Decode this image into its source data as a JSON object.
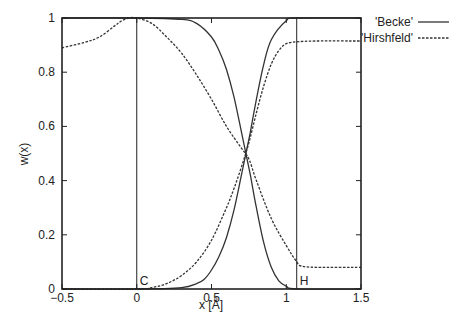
{
  "chart_data": {
    "type": "line",
    "title": "",
    "xlabel": "x [Å]",
    "ylabel": "w(x)",
    "xlim": [
      -0.5,
      1.5
    ],
    "ylim": [
      0,
      1
    ],
    "grid": false,
    "legend_position": "top-right-outside",
    "x_ticks": [
      "-0.5",
      "0",
      "0.5",
      "1",
      "1.5"
    ],
    "y_ticks": [
      "0",
      "0.2",
      "0.4",
      "0.6",
      "0.8",
      "1"
    ],
    "annotations": [
      {
        "label": "C",
        "x": 0.0,
        "note": "vertical line at carbon position"
      },
      {
        "label": "H",
        "x": 1.07,
        "note": "vertical line at hydrogen position"
      }
    ],
    "series": [
      {
        "name": "'Becke'",
        "style": "solid",
        "color": "#333333",
        "curves": [
          {
            "label": "C weight",
            "x": [
              -0.5,
              0.0,
              0.3,
              0.4,
              0.5,
              0.55,
              0.6,
              0.65,
              0.7,
              0.73,
              0.76,
              0.8,
              0.85,
              0.9,
              0.95,
              1.0,
              1.07,
              1.5
            ],
            "y": [
              1.0,
              1.0,
              0.995,
              0.98,
              0.93,
              0.88,
              0.81,
              0.71,
              0.58,
              0.5,
              0.42,
              0.3,
              0.17,
              0.08,
              0.03,
              0.01,
              0.0,
              0.0
            ]
          },
          {
            "label": "H weight",
            "x": [
              -0.5,
              0.0,
              0.3,
              0.4,
              0.45,
              0.5,
              0.55,
              0.6,
              0.65,
              0.7,
              0.73,
              0.76,
              0.8,
              0.85,
              0.9,
              1.0,
              1.07,
              1.5
            ],
            "y": [
              0.0,
              0.0,
              0.005,
              0.02,
              0.035,
              0.07,
              0.12,
              0.19,
              0.29,
              0.42,
              0.5,
              0.58,
              0.7,
              0.83,
              0.92,
              0.99,
              1.0,
              1.0
            ]
          }
        ]
      },
      {
        "name": "'Hirshfeld'",
        "style": "dashed",
        "color": "#333333",
        "curves": [
          {
            "label": "C weight",
            "x": [
              -0.5,
              -0.35,
              -0.25,
              -0.15,
              -0.1,
              -0.05,
              0.0,
              0.1,
              0.2,
              0.3,
              0.4,
              0.5,
              0.6,
              0.7,
              0.75,
              0.8,
              0.9,
              1.0,
              1.07,
              1.1,
              1.2,
              1.5
            ],
            "y": [
              0.89,
              0.91,
              0.93,
              0.97,
              0.99,
              1.0,
              1.0,
              0.98,
              0.93,
              0.87,
              0.79,
              0.7,
              0.6,
              0.52,
              0.48,
              0.4,
              0.26,
              0.16,
              0.1,
              0.085,
              0.08,
              0.08
            ]
          },
          {
            "label": "H weight",
            "x": [
              -0.5,
              0.0,
              0.1,
              0.2,
              0.3,
              0.4,
              0.5,
              0.6,
              0.65,
              0.7,
              0.75,
              0.8,
              0.85,
              0.9,
              0.95,
              1.0,
              1.07,
              1.2,
              1.5
            ],
            "y": [
              0.0,
              0.0,
              0.005,
              0.02,
              0.05,
              0.1,
              0.18,
              0.3,
              0.37,
              0.45,
              0.54,
              0.65,
              0.75,
              0.83,
              0.88,
              0.905,
              0.912,
              0.915,
              0.915
            ]
          }
        ]
      }
    ]
  }
}
